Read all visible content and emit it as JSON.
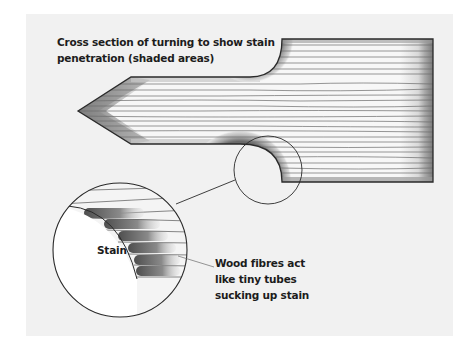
{
  "diagram": {
    "title_lines": [
      "Cross section of turning to show stain",
      "penetration (shaded areas)"
    ],
    "stain_label": "Stain",
    "callout_lines": [
      "Wood fibres act",
      "like tiny tubes",
      "sucking up stain"
    ],
    "colors": {
      "panel_background": "#f1f1f1",
      "outline": "#2a2a2a",
      "grain_line": "#6a6a6a",
      "stain_dark": "#5a5a5a",
      "stain_light": "#d8d8d8",
      "wood_fill": "#f7f7f7"
    }
  }
}
